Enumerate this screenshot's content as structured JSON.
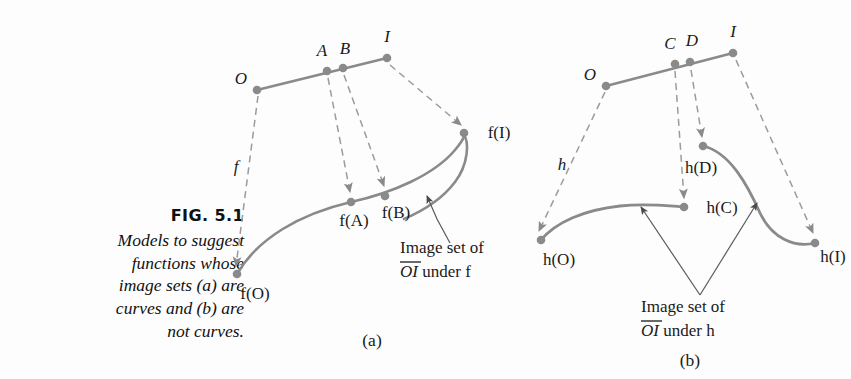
{
  "figure": {
    "number_label": "FIG. 5.1",
    "caption_lines": [
      "Models to suggest",
      "functions whose",
      "image sets (a) are",
      "curves and (b) are",
      "not curves."
    ],
    "caption_full": "Models to suggest functions whose image sets (a) are curves and (b) are not curves."
  },
  "colors": {
    "diagram_stroke": "#8a8a8a",
    "curve_stroke": "#8a8a8a",
    "point_fill": "#8a8a8a",
    "text": "#1a1a1a",
    "background": "#fdfdfd",
    "annotation_line": "#5a5a5a"
  },
  "panels": [
    {
      "id": "a",
      "sub_label": "(a)",
      "function_label": "f",
      "domain_points": [
        {
          "name": "O",
          "label": "O",
          "x": 257,
          "y": 90
        },
        {
          "name": "A",
          "label": "A",
          "x": 327,
          "y": 71
        },
        {
          "name": "B",
          "label": "B",
          "x": 343,
          "y": 68
        },
        {
          "name": "I",
          "label": "I",
          "x": 387,
          "y": 58
        }
      ],
      "image_points": [
        {
          "name": "f(O)",
          "label": "f(O)",
          "x": 237,
          "y": 274
        },
        {
          "name": "f(A)",
          "label": "f(A)",
          "x": 351,
          "y": 202
        },
        {
          "name": "f(B)",
          "label": "f(B)",
          "x": 385,
          "y": 196
        },
        {
          "name": "f(I)",
          "label": "f(I)",
          "x": 464,
          "y": 133
        }
      ],
      "annotation": {
        "line1": "Image set of",
        "line2_segment": "OI",
        "line2_rest": " under f"
      }
    },
    {
      "id": "b",
      "sub_label": "(b)",
      "function_label": "h",
      "domain_points": [
        {
          "name": "O",
          "label": "O",
          "x": 606,
          "y": 86
        },
        {
          "name": "C",
          "label": "C",
          "x": 675,
          "y": 64
        },
        {
          "name": "D",
          "label": "D",
          "x": 690,
          "y": 62
        },
        {
          "name": "I",
          "label": "I",
          "x": 733,
          "y": 53
        }
      ],
      "image_points": [
        {
          "name": "h(O)",
          "label": "h(O)",
          "x": 541,
          "y": 240
        },
        {
          "name": "h(C)",
          "label": "h(C)",
          "x": 684,
          "y": 207
        },
        {
          "name": "h(D)",
          "label": "h(D)",
          "x": 703,
          "y": 146
        },
        {
          "name": "h(I)",
          "label": "h(I)",
          "x": 815,
          "y": 243
        }
      ],
      "annotation": {
        "line1": "Image set of",
        "line2_segment": "OI",
        "line2_rest": " under h"
      }
    }
  ]
}
